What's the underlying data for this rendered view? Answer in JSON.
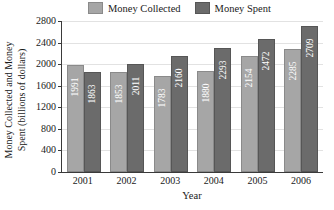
{
  "chart_data": {
    "type": "bar",
    "title": "",
    "xlabel": "Year",
    "ylabel": "Money Collected and Money Spent (billions of dollars)",
    "ylabel_lines": [
      "Money Collected and Money",
      "Spent (billions of dollars)"
    ],
    "categories": [
      "2001",
      "2002",
      "2003",
      "2004",
      "2005",
      "2006"
    ],
    "series": [
      {
        "name": "Money Collected",
        "color": "#a6a6a6",
        "values": [
          1991,
          1853,
          1783,
          1880,
          2154,
          2285
        ]
      },
      {
        "name": "Money Spent",
        "color": "#6b6b6b",
        "values": [
          1863,
          2011,
          2160,
          2293,
          2472,
          2709
        ]
      }
    ],
    "ylim": [
      0,
      2800
    ],
    "ytick_step": 400,
    "yticks": [
      0,
      400,
      800,
      1200,
      1600,
      2000,
      2400,
      2800
    ],
    "ytick_labels": [
      "0",
      "400",
      "800",
      "1200",
      "1600",
      "2000",
      "2400",
      "2800"
    ],
    "grid": true,
    "grid_axis": "y",
    "legend_position": "top"
  },
  "legend": {
    "entries": [
      {
        "label": "Money Collected",
        "color": "#a6a6a6"
      },
      {
        "label": "Money Spent",
        "color": "#6b6b6b"
      }
    ]
  }
}
